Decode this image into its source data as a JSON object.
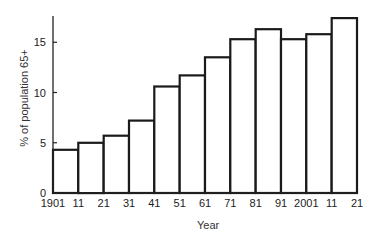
{
  "chart_data": {
    "type": "bar",
    "title": "",
    "xlabel": "Year",
    "ylabel": "% of population 65+",
    "categories": [
      "1901",
      "1911",
      "1921",
      "1931",
      "1941",
      "1951",
      "1961",
      "1971",
      "1981",
      "1991",
      "2001",
      "2011"
    ],
    "values": [
      4.3,
      5.0,
      5.7,
      7.2,
      10.6,
      11.7,
      13.5,
      15.3,
      16.3,
      15.3,
      15.8,
      17.4
    ],
    "x_tick_labels": [
      "1901",
      "11",
      "21",
      "31",
      "41",
      "51",
      "61",
      "71",
      "81",
      "91",
      "2001",
      "11",
      "21"
    ],
    "y_ticks": [
      0,
      5,
      10,
      15
    ],
    "ylim": [
      0,
      17.7
    ],
    "grid": false,
    "legend": null,
    "bar_style": {
      "fill": "#ffffff",
      "stroke": "#1a1a1a"
    }
  }
}
